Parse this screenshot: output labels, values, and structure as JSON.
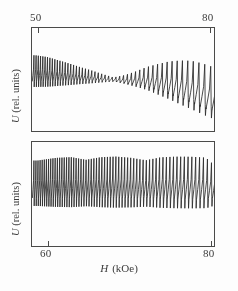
{
  "figure": {
    "xlabel_symbol": "H",
    "xlabel_unit": "(kOe)",
    "ylabel_top": "U  (rel. units)",
    "ylabel_bottom": "U  (rel. units)"
  },
  "axes": {
    "top_ticks": [
      {
        "value": 50,
        "label": "50",
        "x_px": 38
      },
      {
        "value": 80,
        "label": "80",
        "x_px": 210
      }
    ],
    "bottom_ticks": [
      {
        "value": 60,
        "label": "60",
        "x_px": 48
      },
      {
        "value": 80,
        "label": "80",
        "x_px": 211
      }
    ]
  },
  "chart_data": [
    {
      "type": "line",
      "title": "",
      "panel": "top",
      "xlabel": "H (kOe)",
      "ylabel": "U (rel. units)",
      "xlim": [
        47.5,
        81.0
      ],
      "ylim": [
        -1.15,
        1.15
      ],
      "grid": false,
      "legend": null,
      "description": "Quantum oscillation trace: sharp spike-like oscillations whose envelope decays from left, passes through an amplitude node near 62 kOe, then grows strongly toward 80 kOe while the baseline drifts downward.",
      "xticks": [
        50,
        80
      ],
      "signal": {
        "waveform": "sawtooth-spike",
        "period_kOe": 0.72,
        "spike_polarity": "up",
        "envelope_nodes_kOe": [
          62.0
        ],
        "envelope_points": [
          {
            "x": 47.8,
            "amp": 0.62
          },
          {
            "x": 50.0,
            "amp": 0.58
          },
          {
            "x": 52.0,
            "amp": 0.5
          },
          {
            "x": 54.0,
            "amp": 0.42
          },
          {
            "x": 56.0,
            "amp": 0.33
          },
          {
            "x": 58.0,
            "amp": 0.25
          },
          {
            "x": 60.0,
            "amp": 0.16
          },
          {
            "x": 62.0,
            "amp": 0.08
          },
          {
            "x": 64.0,
            "amp": 0.17
          },
          {
            "x": 66.0,
            "amp": 0.3
          },
          {
            "x": 68.0,
            "amp": 0.45
          },
          {
            "x": 70.0,
            "amp": 0.6
          },
          {
            "x": 72.0,
            "amp": 0.74
          },
          {
            "x": 74.0,
            "amp": 0.86
          },
          {
            "x": 76.0,
            "amp": 0.95
          },
          {
            "x": 78.0,
            "amp": 1.0
          },
          {
            "x": 80.0,
            "amp": 1.02
          }
        ],
        "baseline_points": [
          {
            "x": 47.8,
            "y": 0.02
          },
          {
            "x": 55.0,
            "y": 0.0
          },
          {
            "x": 62.0,
            "y": -0.02
          },
          {
            "x": 68.0,
            "y": -0.1
          },
          {
            "x": 72.0,
            "y": -0.22
          },
          {
            "x": 76.0,
            "y": -0.38
          },
          {
            "x": 80.0,
            "y": -0.58
          }
        ]
      }
    },
    {
      "type": "line",
      "title": "",
      "panel": "bottom",
      "xlabel": "H (kOe)",
      "ylabel": "U (rel. units)",
      "xlim": [
        57.0,
        81.5
      ],
      "ylim": [
        -1.15,
        1.15
      ],
      "grid": false,
      "legend": null,
      "description": "Dense large-amplitude quantum oscillations of nearly uniform, near-full-scale amplitude across the whole field range, slightly beating near 64 and 72 kOe, with period increasing toward high field.",
      "xticks": [
        60,
        80
      ],
      "signal": {
        "waveform": "sawtooth-spike",
        "period_kOe": 0.4,
        "spike_polarity": "up",
        "envelope_nodes_kOe": [],
        "envelope_points": [
          {
            "x": 57.5,
            "amp": 0.88
          },
          {
            "x": 60.0,
            "amp": 0.95
          },
          {
            "x": 62.0,
            "amp": 0.97
          },
          {
            "x": 64.0,
            "amp": 0.9
          },
          {
            "x": 66.0,
            "amp": 0.97
          },
          {
            "x": 68.0,
            "amp": 0.99
          },
          {
            "x": 70.0,
            "amp": 0.96
          },
          {
            "x": 72.0,
            "amp": 0.9
          },
          {
            "x": 74.0,
            "amp": 0.98
          },
          {
            "x": 76.0,
            "amp": 1.0
          },
          {
            "x": 78.0,
            "amp": 1.0
          },
          {
            "x": 80.0,
            "amp": 0.98
          },
          {
            "x": 81.0,
            "amp": 0.8
          }
        ],
        "baseline_points": [
          {
            "x": 57.5,
            "y": 0.0
          },
          {
            "x": 65.0,
            "y": 0.0
          },
          {
            "x": 72.0,
            "y": -0.01
          },
          {
            "x": 81.0,
            "y": -0.02
          }
        ]
      }
    }
  ],
  "style": {
    "trace_color": "#2a2a28",
    "frame_color": "#4a4a46",
    "background": "#fdfdfc",
    "text_color": "#3b3b38"
  }
}
